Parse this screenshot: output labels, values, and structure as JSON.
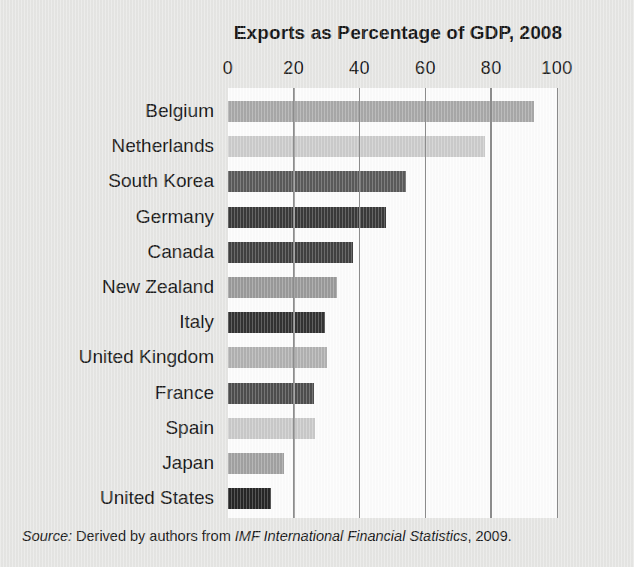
{
  "chart_data": {
    "type": "bar",
    "orientation": "horizontal",
    "title": "Exports as Percentage of GDP, 2008",
    "xlabel": "",
    "ylabel": "",
    "xlim": [
      0,
      100
    ],
    "xticks": [
      0,
      20,
      40,
      60,
      80,
      100
    ],
    "tick_labels": [
      "0",
      "20",
      "40",
      "60",
      "80",
      "100"
    ],
    "grid": "vertical",
    "legend": "none",
    "categories": [
      "Belgium",
      "Netherlands",
      "South Korea",
      "Germany",
      "Canada",
      "New Zealand",
      "Italy",
      "United Kingdom",
      "France",
      "Spain",
      "Japan",
      "United States"
    ],
    "values": [
      93,
      78,
      54,
      48,
      38,
      33,
      29.5,
      30,
      26,
      26.5,
      17,
      13
    ],
    "bar_colors": [
      "#a9a9a9",
      "#cccccc",
      "#5a5a5a",
      "#3a3a3a",
      "#414141",
      "#9a9a9a",
      "#333333",
      "#b2b2b2",
      "#4e4e4e",
      "#cacaca",
      "#a2a2a2",
      "#272727"
    ]
  },
  "source": {
    "label": "Source:",
    "text_before": "Derived by authors from",
    "publication": "IMF International Financial Statistics",
    "text_after": ", 2009."
  },
  "colors": {
    "background": "#e7e7e5",
    "plot_background": "#fdfdfd",
    "gridline": "#8e8e8e",
    "text": "#1b1b1b"
  }
}
